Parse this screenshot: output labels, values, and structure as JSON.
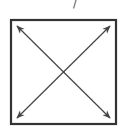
{
  "diagram": {
    "label_fragment": "/",
    "shape": "square",
    "arrows": [
      {
        "name": "diagonal-top-left-to-bottom-right",
        "from": "top-left",
        "to": "bottom-right",
        "bidirectional": true
      },
      {
        "name": "diagonal-top-right-to-bottom-left",
        "from": "top-right",
        "to": "bottom-left",
        "bidirectional": true
      }
    ],
    "colors": {
      "stroke": "#333333",
      "arrow": "#444444",
      "background": "#ffffff"
    }
  }
}
